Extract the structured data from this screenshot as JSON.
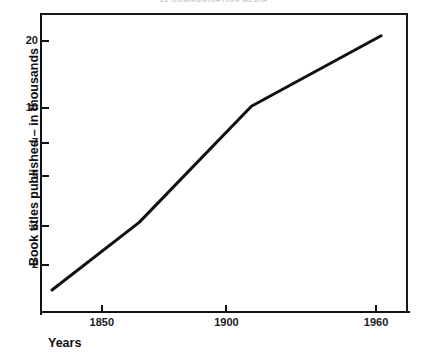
{
  "running_head": "22   COMMUNICATION MEDIA",
  "chart_data": {
    "type": "line",
    "title": "",
    "xlabel": "Years",
    "ylabel": "Book titles published – in thousands",
    "yscale": "log",
    "xscale": "linear",
    "grid": false,
    "legend": "none",
    "xlim": [
      1826,
      1972
    ],
    "ylim": [
      1.25,
      26
    ],
    "x_ticks": [
      1850,
      1900,
      1960
    ],
    "x_tick_labels": [
      "1850",
      "1900",
      "1960"
    ],
    "y_ticks": [
      2,
      3,
      5,
      7,
      10,
      20
    ],
    "y_tick_labels": [
      "2",
      "3",
      "5",
      "7",
      "10",
      "20"
    ],
    "series": [
      {
        "name": "Book titles published",
        "x": [
          1830,
          1865,
          1910,
          1962
        ],
        "values": [
          1.55,
          3.1,
          10.2,
          21.0
        ]
      }
    ]
  },
  "axes": {
    "x_title": "Years",
    "y_title": "Book titles published – in thousands"
  }
}
